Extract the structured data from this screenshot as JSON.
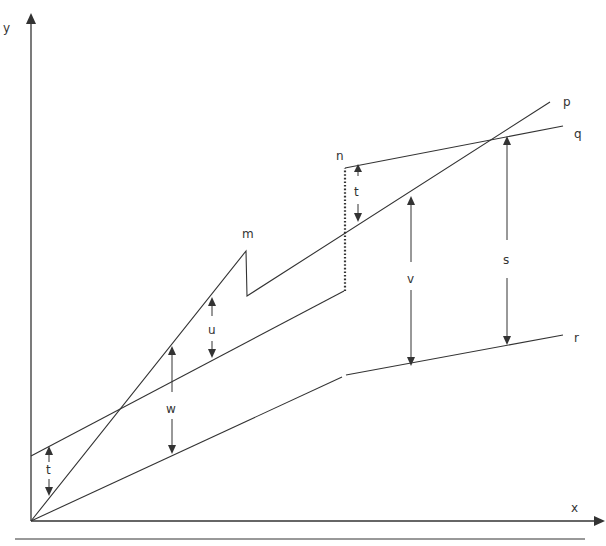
{
  "axes": {
    "x_label": "x",
    "y_label": "y",
    "origin": [
      31,
      521
    ],
    "x_end": [
      604,
      521
    ],
    "y_end": [
      31,
      15
    ]
  },
  "baseline": {
    "from": [
      15,
      539
    ],
    "to": [
      585,
      539
    ]
  },
  "curves": {
    "p": {
      "label": "p",
      "label_pos": [
        563,
        106
      ],
      "points": [
        [
          31,
          521
        ],
        [
          246,
          251
        ],
        [
          247,
          296
        ],
        [
          550,
          102
        ]
      ]
    },
    "q": {
      "label": "q",
      "label_pos": [
        574,
        138
      ],
      "segments": [
        [
          [
            31,
            456
          ],
          [
            344,
            291
          ]
        ],
        [
          [
            345,
            168
          ],
          [
            563,
            126
          ]
        ]
      ],
      "dotted_jump": [
        [
          345,
          291
        ],
        [
          345,
          168
        ]
      ]
    },
    "r": {
      "label": "r",
      "label_pos": [
        574,
        342
      ],
      "segments": [
        [
          [
            31,
            521
          ],
          [
            342,
            377
          ]
        ],
        [
          [
            346,
            375
          ],
          [
            563,
            335
          ]
        ]
      ]
    }
  },
  "point_labels": [
    {
      "id": "m",
      "text": "m",
      "pos": [
        242,
        238
      ]
    },
    {
      "id": "n",
      "text": "n",
      "pos": [
        336,
        160
      ]
    }
  ],
  "measures": [
    {
      "id": "t1",
      "label": "t",
      "x": 49,
      "top": 446,
      "bottom": 496,
      "label_y": 473
    },
    {
      "id": "u",
      "label": "u",
      "x": 212,
      "top": 297,
      "bottom": 358,
      "label_y": 331
    },
    {
      "id": "w",
      "label": "w",
      "x": 172,
      "top": 346,
      "bottom": 454,
      "label_y": 409
    },
    {
      "id": "t2",
      "label": "t",
      "x": 358,
      "top": 164,
      "bottom": 222,
      "label_y": 192
    },
    {
      "id": "v",
      "label": "v",
      "x": 411,
      "top": 196,
      "bottom": 366,
      "label_y": 280
    },
    {
      "id": "s",
      "label": "s",
      "x": 507,
      "top": 136,
      "bottom": 345,
      "label_y": 261
    }
  ],
  "colors": {
    "ink": "#333333",
    "background": "#ffffff"
  }
}
